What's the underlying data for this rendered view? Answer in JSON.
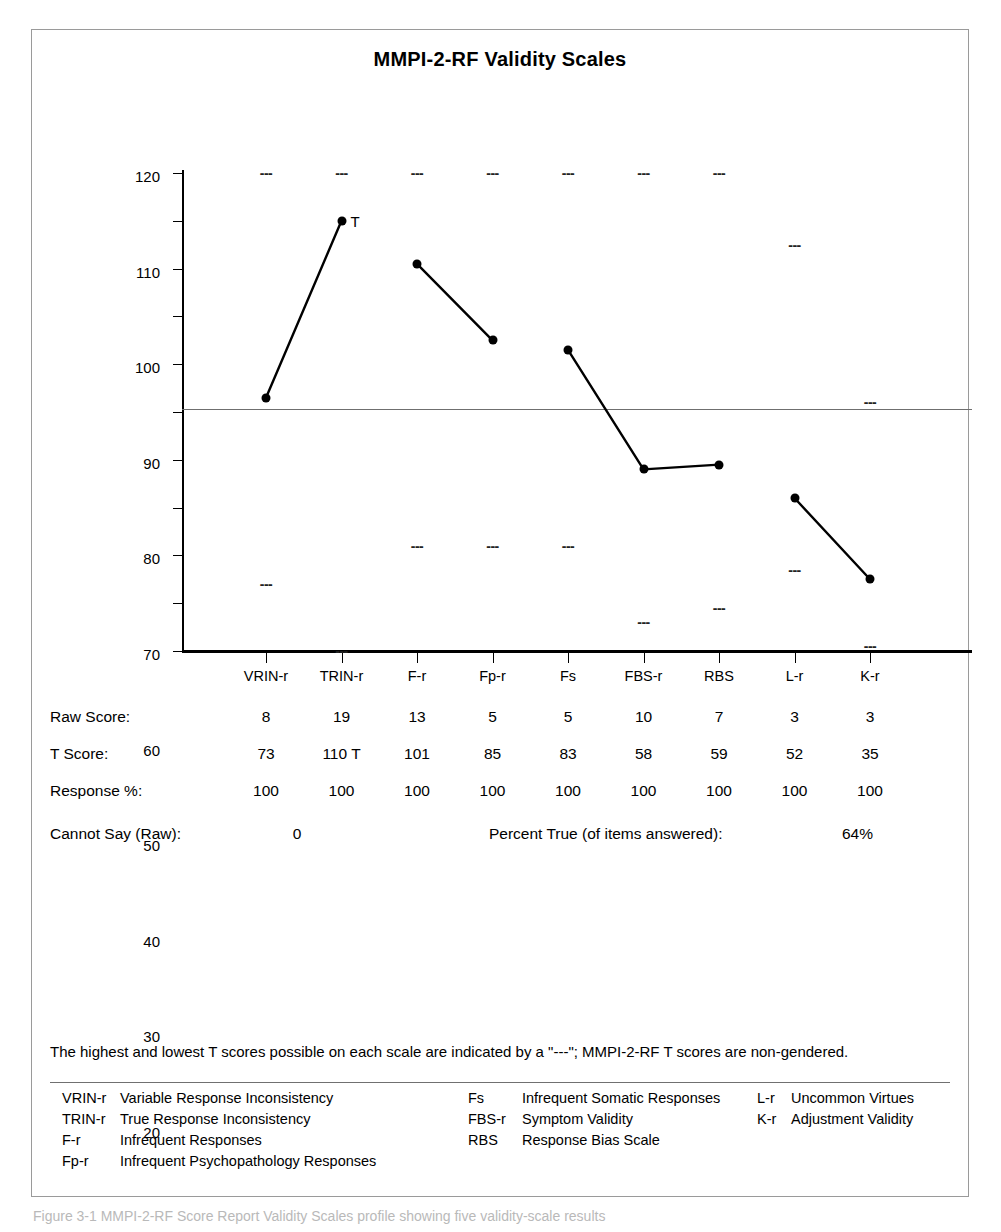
{
  "chart_title": "MMPI-2-RF Validity Scales",
  "chart_data": {
    "type": "line",
    "title": "MMPI-2-RF Validity Scales",
    "xlabel": "",
    "ylabel": "",
    "ylim": [
      20,
      120
    ],
    "yticks": [
      120,
      110,
      100,
      90,
      80,
      70,
      60,
      50,
      40,
      30,
      20
    ],
    "grid": false,
    "reference_line": 50,
    "legend_position": "none",
    "categories": [
      "VRIN-r",
      "TRIN-r",
      "F-r",
      "Fp-r",
      "Fs",
      "FBS-r",
      "RBS",
      "L-r",
      "K-r"
    ],
    "series": [
      {
        "name": "T Score",
        "values": [
          73,
          110,
          101,
          85,
          83,
          58,
          59,
          52,
          35
        ]
      }
    ],
    "connected_segments": [
      [
        0,
        1
      ],
      [
        2,
        3
      ],
      [
        4,
        5,
        6
      ],
      [
        7,
        8
      ]
    ],
    "point_annotations": [
      {
        "category": "TRIN-r",
        "value": 110,
        "label": "T"
      }
    ],
    "max_markers": [
      120,
      120,
      120,
      120,
      120,
      120,
      120,
      105,
      72
    ],
    "min_markers": [
      34,
      20,
      42,
      42,
      42,
      26,
      29,
      37,
      21
    ],
    "marker_glyph": "---"
  },
  "table": {
    "rows": [
      {
        "label": "Raw Score:",
        "values": [
          "8",
          "19",
          "13",
          "5",
          "5",
          "10",
          "7",
          "3",
          "3"
        ]
      },
      {
        "label": "T Score:",
        "values": [
          "73",
          "110 T",
          "101",
          "85",
          "83",
          "58",
          "59",
          "52",
          "35"
        ]
      },
      {
        "label": "Response %:",
        "values": [
          "100",
          "100",
          "100",
          "100",
          "100",
          "100",
          "100",
          "100",
          "100"
        ]
      }
    ],
    "cannot_say_label": "Cannot Say (Raw):",
    "cannot_say_value": "0",
    "percent_true_label": "Percent True (of items answered):",
    "percent_true_value": "64%"
  },
  "footnote": "The highest and lowest T scores possible on each scale are indicated by a \"---\"; MMPI-2-RF T scores are non-gendered.",
  "legend": {
    "column_1": [
      {
        "abbr": "VRIN-r",
        "name": "Variable Response Inconsistency"
      },
      {
        "abbr": "TRIN-r",
        "name": "True Response Inconsistency"
      },
      {
        "abbr": "F-r",
        "name": "Infrequent Responses"
      },
      {
        "abbr": "Fp-r",
        "name": "Infrequent Psychopathology Responses"
      }
    ],
    "column_2": [
      {
        "abbr": "Fs",
        "name": "Infrequent Somatic Responses"
      },
      {
        "abbr": "FBS-r",
        "name": "Symptom Validity"
      },
      {
        "abbr": "RBS",
        "name": "Response Bias Scale"
      }
    ],
    "column_3": [
      {
        "abbr": "L-r",
        "name": "Uncommon Virtues"
      },
      {
        "abbr": "K-r",
        "name": "Adjustment Validity"
      }
    ]
  },
  "caption": "Figure 3-1 MMPI-2-RF Score Report Validity Scales profile showing five validity-scale results"
}
